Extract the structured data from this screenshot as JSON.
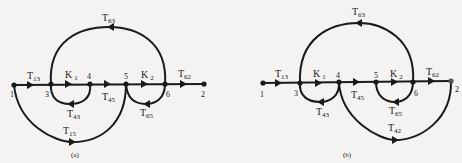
{
  "figures": [
    {
      "caption": "(a)",
      "nodes": [
        "1",
        "3",
        "4",
        "5",
        "6",
        "2"
      ],
      "edges": [
        {
          "from": "1",
          "to": "3",
          "label": "T",
          "sub": "13"
        },
        {
          "from": "3",
          "to": "4",
          "label": "K",
          "sub": "1"
        },
        {
          "from": "4",
          "to": "5",
          "label": "T",
          "sub": "45"
        },
        {
          "from": "5",
          "to": "6",
          "label": "K",
          "sub": "2"
        },
        {
          "from": "6",
          "to": "2",
          "label": "T",
          "sub": "62"
        },
        {
          "from": "6",
          "to": "3",
          "label": "T",
          "sub": "63"
        },
        {
          "from": "4",
          "to": "3",
          "label": "T",
          "sub": "43"
        },
        {
          "from": "6",
          "to": "5",
          "label": "T",
          "sub": "65"
        },
        {
          "from": "1",
          "to": "5",
          "label": "T",
          "sub": "15"
        }
      ]
    },
    {
      "caption": "(b)",
      "nodes": [
        "1",
        "3",
        "4",
        "5",
        "6",
        "2"
      ],
      "edges": [
        {
          "from": "1",
          "to": "3",
          "label": "T",
          "sub": "13"
        },
        {
          "from": "3",
          "to": "4",
          "label": "K",
          "sub": "1"
        },
        {
          "from": "4",
          "to": "5",
          "label": "T",
          "sub": "45"
        },
        {
          "from": "5",
          "to": "6",
          "label": "K",
          "sub": "2"
        },
        {
          "from": "6",
          "to": "2",
          "label": "T",
          "sub": "62"
        },
        {
          "from": "6",
          "to": "3",
          "label": "T",
          "sub": "63"
        },
        {
          "from": "4",
          "to": "3",
          "label": "T",
          "sub": "43"
        },
        {
          "from": "6",
          "to": "5",
          "label": "T",
          "sub": "65"
        },
        {
          "from": "4",
          "to": "2",
          "label": "T",
          "sub": "42"
        }
      ]
    }
  ]
}
